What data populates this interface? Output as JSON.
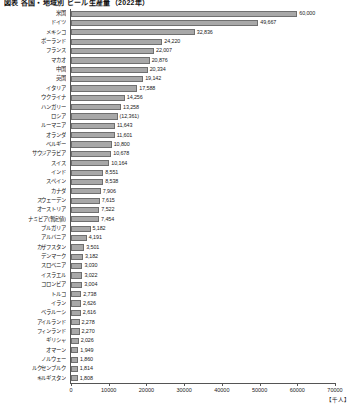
{
  "chart": {
    "title": "図表 各国・地域別 ビール生産量（2022年）",
    "unit_label": "【千人】",
    "axis_max_label": "70000"
  },
  "chart_data": {
    "type": "bar",
    "orientation": "horizontal",
    "title": "図表 各国・地域別 ビール生産量（2022年）",
    "xlabel": "【千人】",
    "ylabel": "",
    "xlim": [
      0,
      70000
    ],
    "grid": false,
    "legend": "none",
    "ticks": [
      "0",
      "10000",
      "20000",
      "30000",
      "40000",
      "50000",
      "60000",
      "70000"
    ],
    "tick_values": [
      0,
      10000,
      20000,
      30000,
      40000,
      50000,
      60000,
      70000
    ],
    "categories": [
      "米国",
      "ドイツ",
      "メキシコ",
      "ポーランド",
      "フランス",
      "マカオ",
      "中国",
      "英国",
      "イタリア",
      "ウクライナ",
      "ハンガリー",
      "ロシア",
      "ルーマニア",
      "オランダ",
      "ベルギー",
      "サウジアラビア",
      "スイス",
      "インド",
      "スペイン",
      "カナダ",
      "スウェーデン",
      "オーストリア",
      "ナミビア(暫定値)",
      "ブルガリア",
      "アルバニア",
      "カザフスタン",
      "デンマーク",
      "スロベニア",
      "イスラエル",
      "コロンビア",
      "トルコ",
      "イラン",
      "ベラルーシ",
      "アイルランド",
      "フィンランド",
      "ギリシャ",
      "オマーン",
      "ノルウェー",
      "ルクセンブルク",
      "キルギスタン"
    ],
    "values": [
      60000,
      49667,
      32836,
      24220,
      22007,
      20876,
      20334,
      19142,
      17588,
      14256,
      13258,
      12361,
      11643,
      11601,
      10800,
      10678,
      10164,
      8551,
      8538,
      7906,
      7615,
      7522,
      7454,
      5182,
      4191,
      3501,
      3182,
      3030,
      3022,
      3004,
      2738,
      2626,
      2616,
      2278,
      2270,
      2026,
      1949,
      1860,
      1814,
      1808
    ],
    "value_labels": [
      "60,000",
      "49,667",
      "32,836",
      "24,220",
      "22,007",
      "20,876",
      "20,334",
      "19,142",
      "17,588",
      "14,256",
      "13,258",
      "(12,361)",
      "11,643",
      "11,601",
      "10,800",
      "10,678",
      "10,164",
      "8,551",
      "8,538",
      "7,906",
      "7,615",
      "7,522",
      "7,454",
      "5,182",
      "4,191",
      "3,501",
      "3,182",
      "3,030",
      "3,022",
      "3,004",
      "2,738",
      "2,626",
      "2,616",
      "2,278",
      "2,270",
      "2,026",
      "1,949",
      "1,860",
      "1,814",
      "1,808"
    ],
    "bar_color": "#a8a8a8",
    "bar_border_color": "#6f6f6f"
  }
}
